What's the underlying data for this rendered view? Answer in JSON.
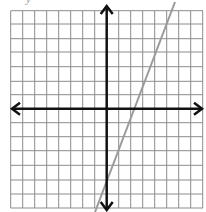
{
  "figure": {
    "title_fragment": "y",
    "grid": {
      "left": 10.7,
      "top": 10.7,
      "right": 203,
      "bottom": 208,
      "x_lines": [
        10.7,
        22.7,
        34.7,
        46.7,
        58.7,
        70.7,
        82.7,
        94.7,
        118.7,
        130.7,
        142.7,
        154.7,
        166.7,
        178.7,
        190.7,
        202.7
      ],
      "y_lines": [
        10.7,
        24,
        38.7,
        52,
        66.7,
        81.3,
        94.7,
        122.7,
        136.7,
        150.7,
        165.3,
        180,
        194,
        208
      ],
      "color": "#8c8c8c"
    },
    "axes": {
      "x_axis_y": 108.7,
      "y_axis_x": 106.7,
      "color": "#111111"
    },
    "line": {
      "equation": "y = 2x - 5",
      "x1": 175,
      "y1": 2,
      "x2": 95,
      "y2": 212,
      "color": "#9a9a9a"
    }
  }
}
